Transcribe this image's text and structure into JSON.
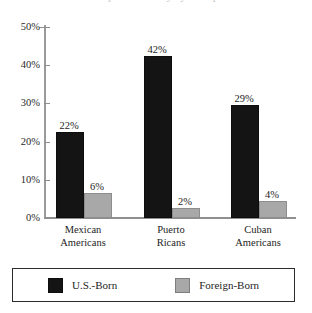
{
  "figure": {
    "title_cropped": "Hispanic Poverty by Group",
    "title_visible": false
  },
  "chart_data": {
    "type": "bar",
    "title": "",
    "xlabel": "",
    "ylabel": "",
    "categories": [
      "Mexican Americans",
      "Puerto Ricans",
      "Cuban Americans"
    ],
    "category_lines": [
      [
        "Mexican",
        "Americans"
      ],
      [
        "Puerto",
        "Ricans"
      ],
      [
        "Cuban",
        "Americans"
      ]
    ],
    "series": [
      {
        "name": "U.S.-Born",
        "color": "#141414",
        "values": [
          22,
          42,
          29
        ],
        "labels": [
          "22%",
          "42%",
          "29%"
        ]
      },
      {
        "name": "Foreign-Born",
        "color": "#a8a8a8",
        "values": [
          6,
          2,
          4
        ],
        "labels": [
          "6%",
          "2%",
          "4%"
        ]
      }
    ],
    "ylim": [
      0,
      50
    ],
    "ytick_values": [
      0,
      10,
      20,
      30,
      40,
      50
    ],
    "ytick_labels": [
      "0%",
      "10%",
      "20%",
      "30%",
      "40%",
      "50%"
    ],
    "grid": false,
    "legend_position": "bottom"
  },
  "legend": {
    "items": [
      {
        "label": "U.S.-Born",
        "color": "#141414"
      },
      {
        "label": "Foreign-Born",
        "color": "#a8a8a8"
      }
    ]
  }
}
